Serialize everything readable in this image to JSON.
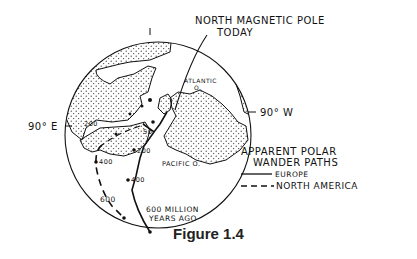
{
  "figure": {
    "caption": "Figure 1.4",
    "labels": {
      "pole_line1": "NORTH MAGNETIC POLE",
      "pole_line2": "TODAY",
      "east": "90° E",
      "west": "90° W",
      "atlantic_1": "ATLANTIC",
      "atlantic_2": "O.",
      "pacific": "PACIFIC O.",
      "age_1": "600 MILLION",
      "age_2": "YEARS AGO"
    },
    "path_ticks": {
      "europe": [
        "50",
        "200",
        "400"
      ],
      "north_america": [
        "200",
        "400",
        "600"
      ]
    },
    "legend": {
      "title_1": "APPARENT POLAR",
      "title_2": "WANDER PATHS",
      "items": [
        {
          "style": "solid",
          "label": "EUROPE"
        },
        {
          "style": "dashed",
          "label": "NORTH AMERICA"
        }
      ]
    }
  }
}
